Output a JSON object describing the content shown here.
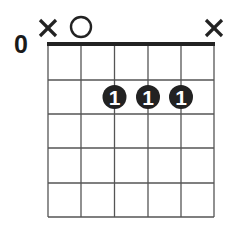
{
  "chord_diagram": {
    "starting_fret_label": "0",
    "strings": 6,
    "frets_shown": 5,
    "string_markers": [
      {
        "string": 6,
        "type": "muted",
        "symbol": "×"
      },
      {
        "string": 5,
        "type": "open",
        "symbol": "○"
      },
      {
        "string": 4,
        "type": "none",
        "symbol": ""
      },
      {
        "string": 3,
        "type": "none",
        "symbol": ""
      },
      {
        "string": 2,
        "type": "none",
        "symbol": ""
      },
      {
        "string": 1,
        "type": "muted",
        "symbol": "×"
      }
    ],
    "finger_dots": [
      {
        "string": 4,
        "fret": 2,
        "finger": "1"
      },
      {
        "string": 3,
        "fret": 2,
        "finger": "1"
      },
      {
        "string": 2,
        "fret": 2,
        "finger": "1"
      }
    ],
    "colors": {
      "line": "#555555",
      "nut": "#222222",
      "dot": "#222222",
      "dot_text": "#ffffff"
    }
  }
}
